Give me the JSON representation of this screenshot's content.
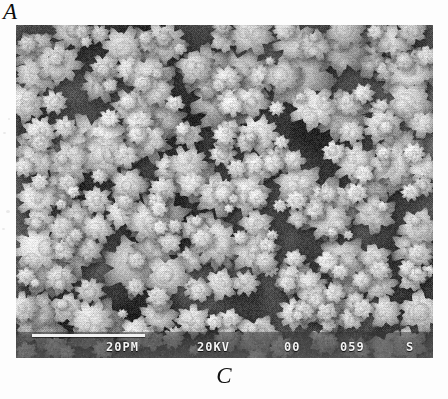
{
  "figure": {
    "panel_letter": "A",
    "caption": "C",
    "background_color": "#fdfdfd"
  },
  "micrograph": {
    "kind": "sem-micrograph",
    "description": "Scanning electron micrograph of a granular, cauliflower-like nodular surface",
    "background_gray": "#6b6b6b",
    "nodule_gray": "#d9d9d9",
    "shadow_gray": "#3a3a3a",
    "width": 417,
    "height": 333
  },
  "scalebar": {
    "bar_label": "20PM",
    "voltage": "20KV",
    "code": "00",
    "serial": "059",
    "mode": "S",
    "bar_color": "#f2f2f2",
    "text_color": "#f4f4f4"
  }
}
